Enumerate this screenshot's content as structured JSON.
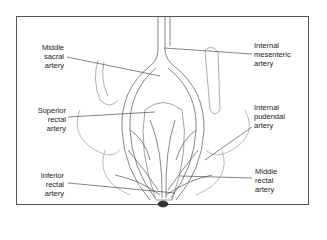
{
  "figure": {
    "labels": {
      "middle_sacral": [
        "Middle",
        "sacral",
        "artery"
      ],
      "superior_rectal": [
        "Superior",
        "rectal",
        "artery"
      ],
      "inferior_rectal": [
        "Inferior",
        "rectal",
        "artery"
      ],
      "internal_mesenteric": [
        "Internal",
        "mesenteric",
        "artery"
      ],
      "internal_pudendal": [
        "Internal",
        "pudendal",
        "artery"
      ],
      "middle_rectal": [
        "Middle",
        "rectal",
        "artery"
      ]
    }
  }
}
